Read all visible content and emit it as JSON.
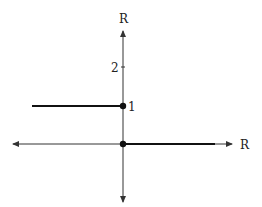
{
  "diagram": {
    "type": "step-function-graph",
    "axes": {
      "x_label": "R",
      "y_label": "R"
    },
    "y_ticks": [
      {
        "label": "2",
        "value": 2
      },
      {
        "label": "1",
        "value": 1
      }
    ],
    "segments": [
      {
        "name": "left-step",
        "from_x": "-inf",
        "to_x": 0,
        "y": 1
      },
      {
        "name": "right-step",
        "from_x": 0,
        "to_x": "+inf",
        "y": 0
      }
    ],
    "points": [
      {
        "name": "point-at-1",
        "x": 0,
        "y": 1,
        "filled": true
      },
      {
        "name": "point-at-origin",
        "x": 0,
        "y": 0,
        "filled": true
      }
    ],
    "colors": {
      "axis": "#333333",
      "graph": "#111111"
    }
  }
}
